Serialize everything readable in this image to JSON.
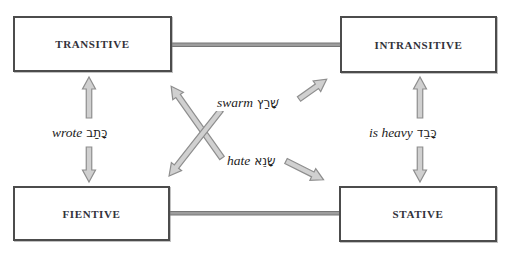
{
  "diagram": {
    "boxes": {
      "transitive": {
        "label": "TRANSITIVE"
      },
      "intransitive": {
        "label": "INTRANSITIVE"
      },
      "fientive": {
        "label": "FIENTIVE"
      },
      "stative": {
        "label": "STATIVE"
      }
    },
    "edge_labels": {
      "wrote": {
        "english": "wrote",
        "hebrew": "כָּתַב"
      },
      "is_heavy": {
        "english": "is heavy",
        "hebrew": "כָּבֵד"
      },
      "swarm": {
        "english": "swarm",
        "hebrew": "שָׁרַץ"
      },
      "hate": {
        "english": "hate",
        "hebrew": "שָׂנֵא"
      }
    },
    "colors": {
      "box_border": "#4c4c4c",
      "box_text": "#32323a",
      "connector_bar": "#9d9d9d",
      "arrow_fill": "#d0d0d0",
      "arrow_outline": "#8e8e8e",
      "background": "#ffffff"
    }
  }
}
